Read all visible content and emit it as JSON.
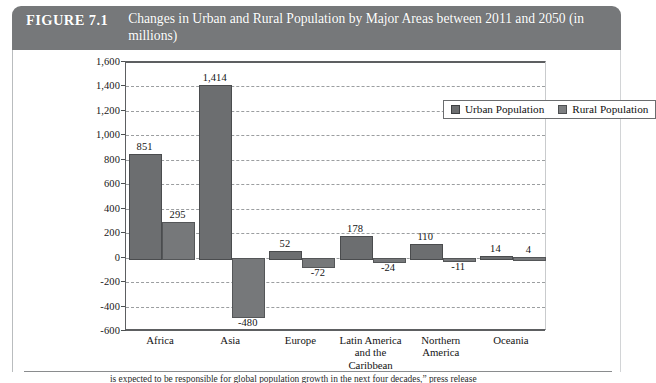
{
  "figure": {
    "number": "FIGURE 7.1",
    "title": "Changes in Urban and Rural Population by Major Areas between 2011 and 2050 (in millions)"
  },
  "caption": {
    "clipped_text": "is expected to be responsible for global population growth in the next four decades,” press release"
  },
  "colors": {
    "banner": "#76787a",
    "urban_bar": "#6c6e70",
    "rural_bar": "#76787a",
    "axis": "#5d5f61",
    "gridline": "#9b9ea0"
  },
  "chart_data": {
    "type": "bar",
    "title": "Changes in Urban and Rural Population by Major Areas between 2011 and 2050 (in millions)",
    "xlabel": "",
    "ylabel": "",
    "ylim": [
      -600,
      1600
    ],
    "ytick_step": 200,
    "yticks": [
      "1,600",
      "1,400",
      "1,200",
      "1,000",
      "800",
      "600",
      "400",
      "200",
      "0",
      "-200",
      "-400",
      "-600"
    ],
    "ytick_values": [
      1600,
      1400,
      1200,
      1000,
      800,
      600,
      400,
      200,
      0,
      -200,
      -400,
      -600
    ],
    "grid": true,
    "legend_position": "inside-top-right",
    "categories": [
      "Africa",
      "Asia",
      "Europe",
      "Latin America and the Caribbean",
      "Northern America",
      "Oceania"
    ],
    "category_label_lines": [
      [
        "Africa"
      ],
      [
        "Asia"
      ],
      [
        "Europe"
      ],
      [
        "Latin America",
        "and the",
        "Caribbean"
      ],
      [
        "Northern",
        "America"
      ],
      [
        "Oceania"
      ]
    ],
    "series": [
      {
        "name": "Urban Population",
        "values": [
          851,
          1414,
          52,
          178,
          110,
          14
        ],
        "labels": [
          "851",
          "1,414",
          "52",
          "178",
          "110",
          "14"
        ]
      },
      {
        "name": "Rural Population",
        "values": [
          295,
          -480,
          -72,
          -24,
          -11,
          4
        ],
        "labels": [
          "295",
          "-480",
          "-72",
          "-24",
          "-11",
          "4"
        ]
      }
    ]
  }
}
